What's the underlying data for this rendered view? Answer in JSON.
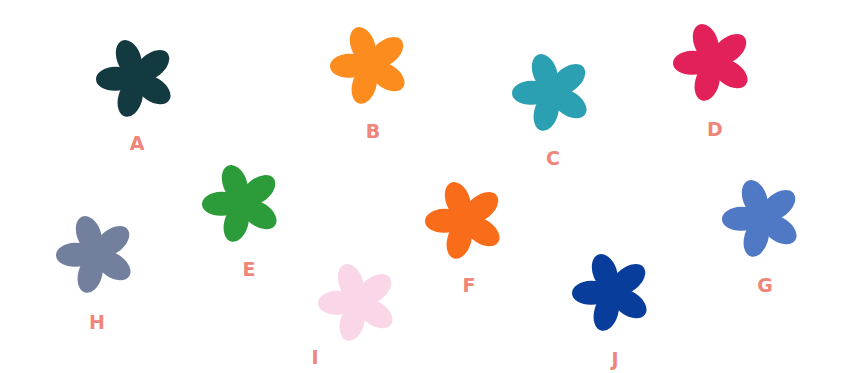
{
  "flowers": [
    {
      "id": "A",
      "label": "A",
      "color": "#133a40",
      "x": 96,
      "y": 38,
      "lx": 122,
      "ly": 134
    },
    {
      "id": "B",
      "label": "B",
      "color": "#fd8c1f",
      "x": 330,
      "y": 25,
      "lx": 358,
      "ly": 122
    },
    {
      "id": "C",
      "label": "C",
      "color": "#2aa0b2",
      "x": 512,
      "y": 52,
      "lx": 538,
      "ly": 149
    },
    {
      "id": "D",
      "label": "D",
      "color": "#e2215a",
      "x": 673,
      "y": 22,
      "lx": 700,
      "ly": 120
    },
    {
      "id": "E",
      "label": "E",
      "color": "#2c9b3a",
      "x": 202,
      "y": 163,
      "lx": 234,
      "ly": 260
    },
    {
      "id": "F",
      "label": "F",
      "color": "#f86c1a",
      "x": 425,
      "y": 180,
      "lx": 454,
      "ly": 276
    },
    {
      "id": "G",
      "label": "G",
      "color": "#4f78c5",
      "x": 722,
      "y": 178,
      "lx": 750,
      "ly": 276
    },
    {
      "id": "H",
      "label": "H",
      "color": "#73809d",
      "x": 56,
      "y": 214,
      "lx": 82,
      "ly": 313
    },
    {
      "id": "I",
      "label": "I",
      "color": "#f9d6e8",
      "x": 318,
      "y": 262,
      "lx": 300,
      "ly": 348
    },
    {
      "id": "J",
      "label": "J",
      "color": "#083d9b",
      "x": 572,
      "y": 252,
      "lx": 600,
      "ly": 350
    }
  ]
}
